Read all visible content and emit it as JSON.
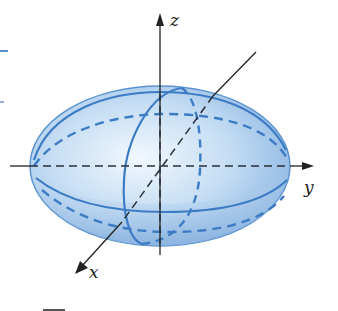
{
  "figure": {
    "type": "ellipsoid",
    "colors": {
      "fill_light": "#eaf3fc",
      "fill_mid": "#b9d6f1",
      "fill_dark": "#8fb8e4",
      "outline": "#3d7cc4",
      "axis": "#222222"
    },
    "axes": {
      "x": {
        "label": "x"
      },
      "y": {
        "label": "y"
      },
      "z": {
        "label": "z"
      }
    }
  }
}
